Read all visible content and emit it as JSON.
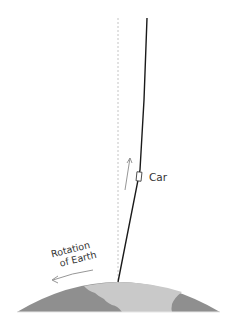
{
  "diagram": {
    "labels": {
      "car": "Car",
      "rotation_line1": "Rotation",
      "rotation_line2": "of Earth"
    },
    "colors": {
      "ocean": "#8c8c8c",
      "land": "#c8c8c8",
      "path": "#111111",
      "reference_line": "#bbbbbb",
      "arrow": "#888888"
    }
  }
}
